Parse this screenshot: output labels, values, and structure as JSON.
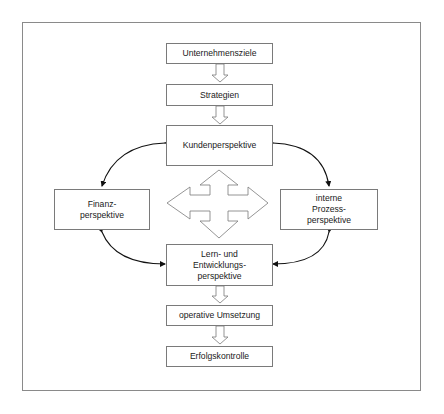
{
  "diagram": {
    "type": "flow-diagram",
    "nodes": {
      "goals": {
        "lines": [
          "Unternehmensziele"
        ]
      },
      "strategies": {
        "lines": [
          "Strategien"
        ]
      },
      "customer": {
        "lines": [
          "Kundenperspektive"
        ]
      },
      "finance": {
        "lines": [
          "Finanz-",
          "perspektive"
        ]
      },
      "process": {
        "lines": [
          "interne",
          "Prozess-",
          "perspektive"
        ]
      },
      "learning": {
        "lines": [
          "Lern- und",
          "Entwicklungs-",
          "perspektive"
        ]
      },
      "operations": {
        "lines": [
          "operative Umsetzung"
        ]
      },
      "control": {
        "lines": [
          "Erfolgskontrolle"
        ]
      }
    },
    "edges": [
      {
        "from": "Unternehmensziele",
        "to": "Strategien",
        "style": "block-arrow"
      },
      {
        "from": "Strategien",
        "to": "Kundenperspektive",
        "style": "block-arrow"
      },
      {
        "from": "Kundenperspektive",
        "to": "Finanz-perspektive",
        "style": "curved-bidirectional"
      },
      {
        "from": "Kundenperspektive",
        "to": "interne Prozess-perspektive",
        "style": "curved-bidirectional"
      },
      {
        "from": "Finanz-perspektive",
        "to": "Lern- und Entwicklungs-perspektive",
        "style": "curved-bidirectional"
      },
      {
        "from": "interne Prozess-perspektive",
        "to": "Lern- und Entwicklungs-perspektive",
        "style": "curved-bidirectional"
      },
      {
        "from": "Lern- und Entwicklungs-perspektive",
        "to": "operative Umsetzung",
        "style": "block-arrow"
      },
      {
        "from": "operative Umsetzung",
        "to": "Erfolgskontrolle",
        "style": "block-arrow"
      }
    ],
    "center_symbol": "four-way-arrow",
    "colors": {
      "stroke": "#7a7a7a",
      "curve": "#111111",
      "fill": "#ffffff"
    }
  }
}
